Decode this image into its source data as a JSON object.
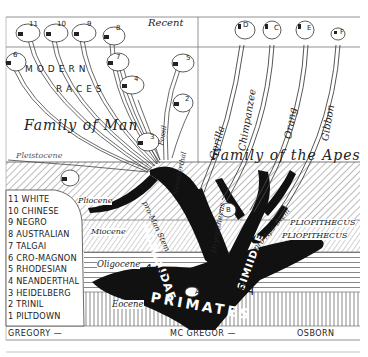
{
  "epochs": {
    "recent": "Recent",
    "pleistocene": "Pleistocene",
    "pliocene": "Pliocene",
    "miocene": "Miocene",
    "oligocene": "Oligocene",
    "eocene": "Eocene"
  },
  "groups": {
    "modern_races_line1": "MODERN",
    "modern_races_line2": "RACES",
    "family_of_man": "Family of Man",
    "family_of_apes": "Family of the Apes",
    "hominidae": "HOMINIDAE",
    "simiidae": "SIMIIDAE",
    "anthropoidea": "ANTHROPOIDEA",
    "primates": "PRIMATES",
    "pro_man_stem": "pro-Man Stem",
    "pro_ape_stem": "pro-Ape Stem",
    "fossil_branch": "Fossil",
    "neanderthal_branch": "Neanderthal",
    "dryopithecus": "Dryopithecus",
    "pliopithecus_1": "PLIOPITHECUS",
    "pliopithecus_2": "PLIOPITHECUS"
  },
  "apes": [
    "Gorilla",
    "Chimpanzee",
    "Orang",
    "Gibbon"
  ],
  "ape_skull_letters": [
    "D",
    "C",
    "E",
    "F"
  ],
  "fossil_skull_letters": [
    "B",
    "A"
  ],
  "human_skull_numbers": [
    "11",
    "10",
    "9",
    "8",
    "7",
    "6",
    "5",
    "4",
    "3",
    "2",
    "1"
  ],
  "legend": [
    "11 WHITE",
    "10 CHINESE",
    "9 NEGRO",
    "8 AUSTRALIAN",
    "7 TALGAI",
    "6 CRO-MAGNON",
    "5 RHODESIAN",
    "4 NEANDERTHAL",
    "3 HEIDELBERG",
    "2 TRINIL",
    "1 PILTDOWN"
  ],
  "credits": {
    "left": "GREGORY —",
    "center": "MC GREGOR —",
    "right": "OSBORN"
  }
}
